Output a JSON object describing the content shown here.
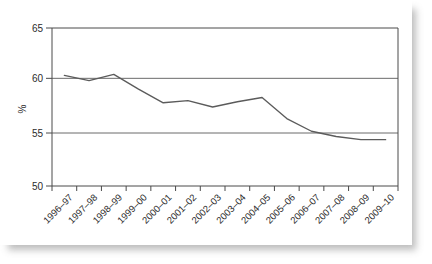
{
  "chart_data": {
    "type": "line",
    "title": "",
    "xlabel": "",
    "ylabel": "%",
    "ylim": [
      50,
      65
    ],
    "yticks": [
      50,
      55,
      60,
      65
    ],
    "ytick_labels": [
      "50",
      "55",
      "60",
      "65"
    ],
    "grid": "horizontal",
    "gridlines_at": [
      55,
      60
    ],
    "legend": "none",
    "categories": [
      "1996–97",
      "1997–98",
      "1998–99",
      "1999–00",
      "2000–01",
      "2001–02",
      "2002–03",
      "2003–04",
      "2004–05",
      "2005–06",
      "2006–07",
      "2007–08",
      "2008–09",
      "2009–10"
    ],
    "values": [
      60.5,
      60.0,
      60.6,
      59.2,
      57.9,
      58.1,
      57.5,
      58.0,
      58.4,
      56.4,
      55.2,
      54.7,
      54.4,
      54.4
    ],
    "series": [
      {
        "name": "",
        "color": "#5b5b5b",
        "values": [
          60.5,
          60.0,
          60.6,
          59.2,
          57.9,
          58.1,
          57.5,
          58.0,
          58.4,
          56.4,
          55.2,
          54.7,
          54.4,
          54.4
        ]
      }
    ]
  },
  "colors": {
    "line": "#5b5b5b",
    "axis": "#4a4a4a",
    "grid": "#5a5a5a",
    "text": "#2b2b2b",
    "background": "#ffffff"
  }
}
